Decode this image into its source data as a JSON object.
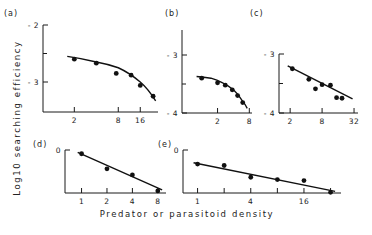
{
  "figure": {
    "ylabel": "Log10 searching efficiency",
    "xlabel": "Predator or parasitoid density"
  },
  "chart_data": [
    {
      "panel": "(a)",
      "type": "scatter",
      "fit": "curve",
      "xscale": "log2",
      "xticks": [
        2,
        8,
        16
      ],
      "yticks": [
        -2,
        -3
      ],
      "ylim": [
        -2,
        -3.6
      ],
      "x": [
        2,
        4,
        7.5,
        12,
        16,
        24
      ],
      "y": [
        -2.6,
        -2.67,
        -2.85,
        -2.88,
        -3.06,
        -3.25
      ],
      "fit_line": [
        [
          1.6,
          -2.55
        ],
        [
          4,
          -2.65
        ],
        [
          8,
          -2.75
        ],
        [
          16,
          -3.0
        ],
        [
          26,
          -3.33
        ]
      ]
    },
    {
      "panel": "(b)",
      "type": "scatter",
      "fit": "curve",
      "xscale": "log2",
      "xticks": [
        2,
        8
      ],
      "yticks": [
        -3,
        -4
      ],
      "ylim": [
        -2.5,
        -4
      ],
      "x": [
        1.0,
        2.0,
        2.8,
        3.8,
        4.8,
        6.0
      ],
      "y": [
        -3.4,
        -3.48,
        -3.52,
        -3.6,
        -3.7,
        -3.82
      ],
      "fit_line": [
        [
          0.8,
          -3.37
        ],
        [
          1.5,
          -3.4
        ],
        [
          2.5,
          -3.48
        ],
        [
          4,
          -3.6
        ],
        [
          6,
          -3.8
        ],
        [
          7.3,
          -3.92
        ]
      ]
    },
    {
      "panel": "(c)",
      "type": "scatter",
      "fit": "linear",
      "xscale": "log2",
      "xticks": [
        2,
        8,
        32
      ],
      "yticks": [
        -3,
        -4
      ],
      "ylim": [
        -3,
        -4
      ],
      "x": [
        2.2,
        4.5,
        6.0,
        8.0,
        11.5,
        15.0,
        19.0
      ],
      "y": [
        -3.25,
        -3.43,
        -3.59,
        -3.52,
        -3.53,
        -3.74,
        -3.75
      ],
      "fit_line": [
        [
          1.8,
          -3.2
        ],
        [
          30,
          -3.76
        ]
      ]
    },
    {
      "panel": "(d)",
      "type": "scatter",
      "fit": "linear",
      "xscale": "log2",
      "xticks": [
        1,
        2,
        4,
        8
      ],
      "yticks": [
        0
      ],
      "ylim": [
        0,
        -1
      ],
      "x": [
        1,
        2,
        4,
        8
      ],
      "y": [
        -0.08,
        -0.4,
        -0.53,
        -0.87
      ],
      "fit_line": [
        [
          0.9,
          -0.05
        ],
        [
          9,
          -0.85
        ]
      ]
    },
    {
      "panel": "(e)",
      "type": "scatter",
      "fit": "linear",
      "xscale": "log2",
      "xticks": [
        1,
        4,
        16
      ],
      "yticks": [
        0
      ],
      "ylim": [
        0,
        -1
      ],
      "x": [
        1,
        2,
        4,
        8,
        16,
        32
      ],
      "y": [
        -0.3,
        -0.33,
        -0.58,
        -0.63,
        -0.65,
        -0.9
      ],
      "fit_line": [
        [
          0.9,
          -0.27
        ],
        [
          36,
          -0.88
        ]
      ]
    }
  ]
}
